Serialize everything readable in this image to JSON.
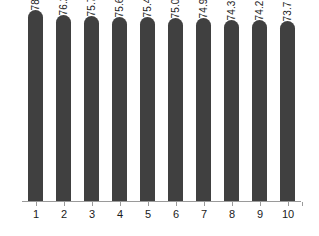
{
  "chart_data": {
    "type": "bar",
    "title": "",
    "subtitle": "",
    "xlabel": "",
    "ylabel": "",
    "categories": [
      "1",
      "2",
      "3",
      "4",
      "5",
      "6",
      "7",
      "8",
      "9",
      "10"
    ],
    "values": [
      78.3,
      76.2,
      75.7,
      75.6,
      75.4,
      75.0,
      74.9,
      74.3,
      74.2,
      73.7
    ],
    "value_labels": [
      "78.3",
      "76.2",
      "75.7",
      "75.6",
      "75.4",
      "75.0",
      "74.9",
      "74.3",
      "74.2",
      "73.7"
    ],
    "series": [
      {
        "name": "",
        "values": [
          78.3,
          76.2,
          75.7,
          75.6,
          75.4,
          75.0,
          74.9,
          74.3,
          74.2,
          73.7
        ]
      }
    ],
    "ylim": [
      0,
      80
    ],
    "grid": false,
    "legend": false,
    "legend_position": "none",
    "value_label_rotation": -90,
    "bar_color": "#404040",
    "axis_color": "#9a9a9a",
    "background_color": "#ffffff",
    "text_color": "#1a1a1a",
    "annotations": []
  }
}
